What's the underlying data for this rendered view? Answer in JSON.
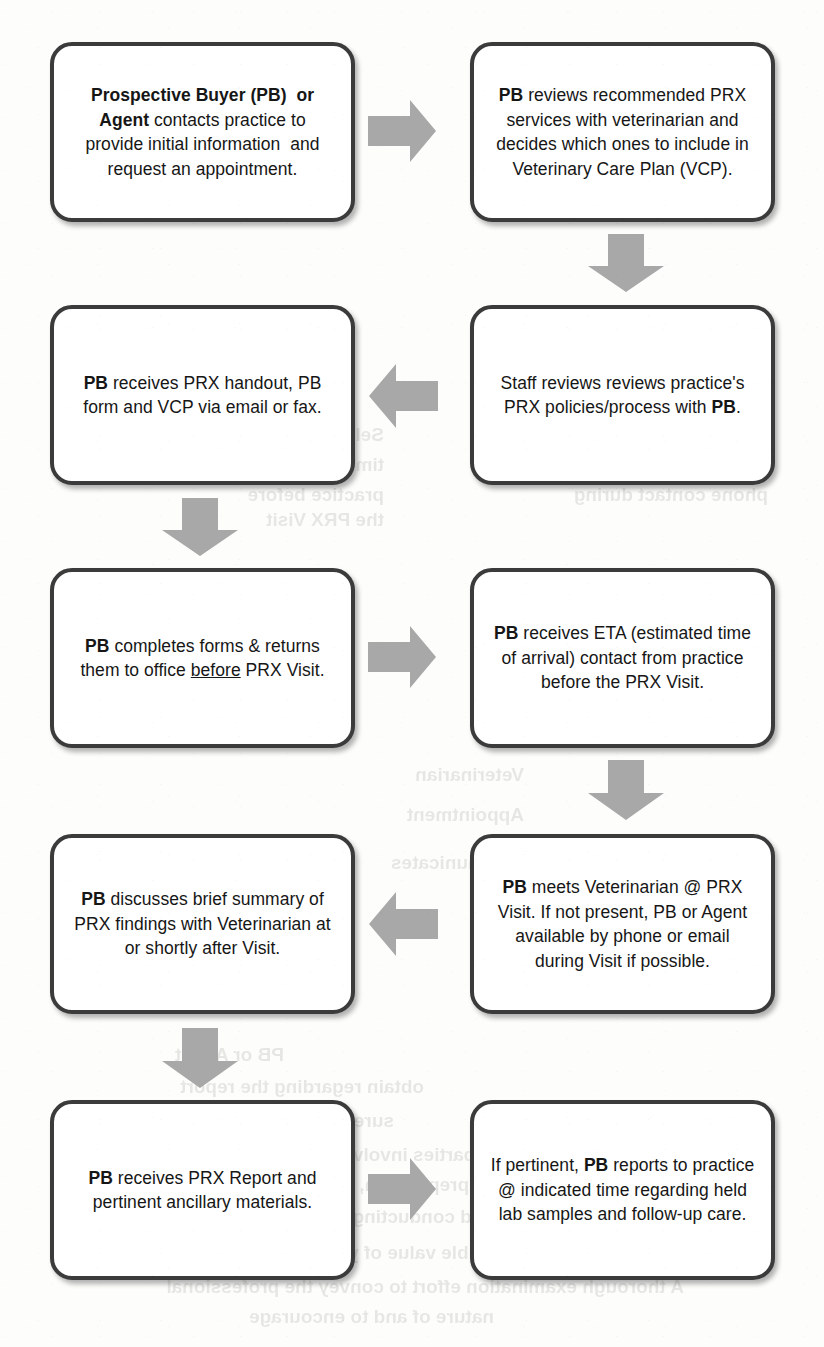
{
  "document": {
    "type": "flowchart",
    "title": "PRX Visit Process Flow",
    "orientation": "two-column serpentine"
  },
  "style": {
    "box_border_color": "#3b3b3b",
    "box_fill_color": "#ffffff",
    "arrow_color": "#a6a6a6",
    "text_color": "#161616"
  },
  "nodes": [
    {
      "id": "n1",
      "order": 1,
      "html": "<b>Prospective Buyer (PB)&nbsp; or Agent</b> contacts practice to provide initial information&nbsp; and request an appointment.",
      "plain": "Prospective Buyer (PB) or Agent contacts practice to provide initial information and request an appointment."
    },
    {
      "id": "n2",
      "order": 2,
      "html": "<b>PB</b> reviews recommended PRX services with veterinarian and decides which ones to include in Veterinary Care Plan (VCP).",
      "plain": "PB reviews recommended PRX services with veterinarian and decides which ones to include in Veterinary Care Plan (VCP)."
    },
    {
      "id": "n3",
      "order": 3,
      "html": "Staff reviews reviews practice's PRX policies/process with <b>PB</b>.",
      "plain": "Staff reviews reviews practice's PRX policies/process with PB."
    },
    {
      "id": "n4",
      "order": 4,
      "html": "<b>PB</b> receives PRX handout, PB form and VCP via email or fax.",
      "plain": "PB receives PRX handout, PB form and VCP via email or fax."
    },
    {
      "id": "n5",
      "order": 5,
      "html": "<b>PB</b> completes forms &amp; returns them to office <u>before</u> PRX Visit.",
      "plain": "PB completes forms & returns them to office before PRX Visit."
    },
    {
      "id": "n6",
      "order": 6,
      "html": "<b>PB</b> receives ETA (estimated time of arrival) contact from practice before the PRX Visit.",
      "plain": "PB receives ETA (estimated time of arrival) contact from practice before the PRX Visit."
    },
    {
      "id": "n7",
      "order": 7,
      "html": "<b>PB</b> meets Veterinarian @ PRX Visit. If not present, PB or Agent available by phone or email during Visit if possible.",
      "plain": "PB meets Veterinarian @ PRX Visit. If not present, PB or Agent available by phone or email during Visit if possible."
    },
    {
      "id": "n8",
      "order": 8,
      "html": "<b>PB</b> discusses brief summary of PRX findings with Veterinarian at or shortly after Visit.",
      "plain": "PB discusses brief summary of PRX findings with Veterinarian at or shortly after Visit."
    },
    {
      "id": "n9",
      "order": 9,
      "html": "<b>PB</b> receives PRX Report and pertinent ancillary materials.",
      "plain": "PB receives PRX Report and pertinent ancillary materials."
    },
    {
      "id": "n10",
      "order": 10,
      "html": "If pertinent, <b>PB</b> reports to practice @ indicated time regarding held lab samples and follow-up care.",
      "plain": "If pertinent, PB reports to practice @ indicated time regarding held lab samples and follow-up care."
    }
  ],
  "arrows": [
    {
      "id": "a1",
      "from": "n1",
      "to": "n2",
      "direction": "right"
    },
    {
      "id": "a2",
      "from": "n2",
      "to": "n3",
      "direction": "down"
    },
    {
      "id": "a3",
      "from": "n3",
      "to": "n4",
      "direction": "left"
    },
    {
      "id": "a4",
      "from": "n4",
      "to": "n5",
      "direction": "down"
    },
    {
      "id": "a5",
      "from": "n5",
      "to": "n6",
      "direction": "right"
    },
    {
      "id": "a6",
      "from": "n6",
      "to": "n7",
      "direction": "down"
    },
    {
      "id": "a7",
      "from": "n7",
      "to": "n8",
      "direction": "left"
    },
    {
      "id": "a8",
      "from": "n8",
      "to": "n9",
      "direction": "down"
    },
    {
      "id": "a9",
      "from": "n9",
      "to": "n10",
      "direction": "right"
    }
  ],
  "bleed_through": [
    {
      "text": "Seller or Seller's Agent present",
      "x": 56,
      "y": 420
    },
    {
      "text": "for PRX Visit, if not present",
      "x": 56,
      "y": 450
    },
    {
      "text": "phone contact during",
      "x": 56,
      "y": 480
    },
    {
      "text": "Seller receives ETA estimated",
      "x": 440,
      "y": 420
    },
    {
      "text": "time of arrival) contact from",
      "x": 440,
      "y": 450
    },
    {
      "text": "practice before",
      "x": 440,
      "y": 480
    },
    {
      "text": "the PRX Visit",
      "x": 440,
      "y": 505
    },
    {
      "text": "Veterinarian",
      "x": 300,
      "y": 760
    },
    {
      "text": "Appointment",
      "x": 300,
      "y": 800
    },
    {
      "text": "communicates",
      "x": 300,
      "y": 848
    },
    {
      "text": "PB or Agent",
      "x": 540,
      "y": 1040
    },
    {
      "text": "obtain regarding the report",
      "x": 400,
      "y": 1072
    },
    {
      "text": "sure excellent  service",
      "x": 430,
      "y": 1106
    },
    {
      "text": "make the expectations of all parties involved regarding the scope of",
      "x": 90,
      "y": 1140
    },
    {
      "text": "and limitations, report preparation, cost",
      "x": 150,
      "y": 1170
    },
    {
      "text": "and conducting a  PRX Visit",
      "x": 330,
      "y": 1202
    },
    {
      "text": "to assess the possible value of your services.",
      "x": 180,
      "y": 1238
    },
    {
      "text": "A thorough examination  effort to convey the professional",
      "x": 140,
      "y": 1272
    },
    {
      "text": "nature of and to encourage",
      "x": 330,
      "y": 1302
    }
  ]
}
